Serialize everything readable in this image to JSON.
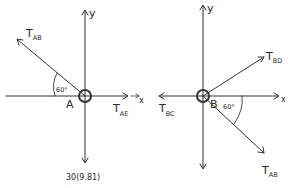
{
  "diagram": {
    "type": "free-body-diagrams",
    "colors": {
      "ink": "#333333",
      "background": "#ffffff"
    },
    "left": {
      "point_label": "A",
      "axis_x_label": "x",
      "axis_y_label": "y",
      "forces": [
        {
          "name": "T",
          "subscript": "AB",
          "direction": "upper-left",
          "angle_label": "60°",
          "angle_ref": "negative x-axis"
        },
        {
          "name": "T",
          "subscript": "AE",
          "direction": "+x"
        },
        {
          "label": "30(9.81)",
          "direction": "-y"
        }
      ],
      "tab_main": "T",
      "tab_sub": "AB",
      "tae_main": "T",
      "tae_sub": "AE",
      "weight_label": "30(9.81)",
      "angle_label": "60°"
    },
    "right": {
      "point_label": "B",
      "axis_x_label": "x",
      "axis_y_label": "y",
      "forces": [
        {
          "name": "T",
          "subscript": "BD",
          "direction": "upper-right"
        },
        {
          "name": "T",
          "subscript": "BC",
          "direction": "-x"
        },
        {
          "name": "T",
          "subscript": "AB",
          "direction": "lower-right",
          "angle_label": "60°",
          "angle_ref": "positive x-axis"
        }
      ],
      "tbd_main": "T",
      "tbd_sub": "BD",
      "tbc_main": "T",
      "tbc_sub": "BC",
      "tab_main": "T",
      "tab_sub": "AB",
      "angle_label": "60°"
    }
  }
}
